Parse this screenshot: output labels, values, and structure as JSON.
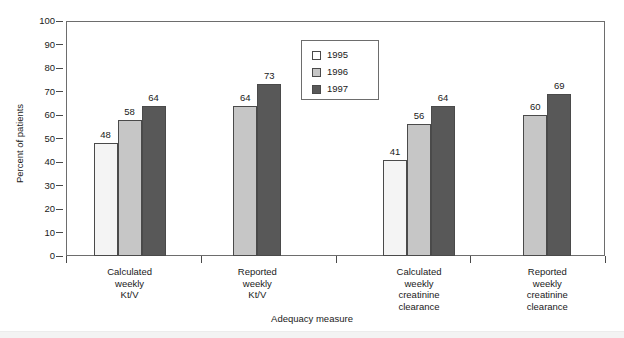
{
  "chart_data": {
    "type": "bar",
    "title": "",
    "xlabel": "Adequacy measure",
    "ylabel": "Percent of patients",
    "ylim": [
      0,
      100
    ],
    "ytick_step": 10,
    "yticks": [
      100,
      90,
      80,
      70,
      60,
      50,
      40,
      30,
      20,
      10,
      0
    ],
    "grid": false,
    "legend_position": "upper center",
    "categories": [
      "Calculated weekly Kt/V",
      "Reported weekly Kt/V",
      "Calculated weekly creatinine clearance",
      "Reported weekly creatinine clearance"
    ],
    "category_lines": [
      [
        "Calculated",
        "weekly",
        "Kt/V"
      ],
      [
        "Reported",
        "weekly",
        "Kt/V"
      ],
      [
        "Calculated",
        "weekly",
        "creatinine",
        "clearance"
      ],
      [
        "Reported",
        "weekly",
        "creatinine",
        "clearance"
      ]
    ],
    "series": [
      {
        "name": "1995",
        "color": "#f4f4f4",
        "values": [
          48,
          null,
          41,
          null
        ]
      },
      {
        "name": "1996",
        "color": "#c6c6c6",
        "values": [
          58,
          64,
          56,
          60
        ]
      },
      {
        "name": "1997",
        "color": "#585858",
        "values": [
          64,
          73,
          64,
          69
        ]
      }
    ]
  },
  "legend": {
    "items": [
      {
        "label": "1995",
        "series": "s1995"
      },
      {
        "label": "1996",
        "series": "s1996"
      },
      {
        "label": "1997",
        "series": "s1997"
      }
    ]
  },
  "axes": {
    "y_title": "Percent of patients",
    "x_title": "Adequacy measure"
  }
}
